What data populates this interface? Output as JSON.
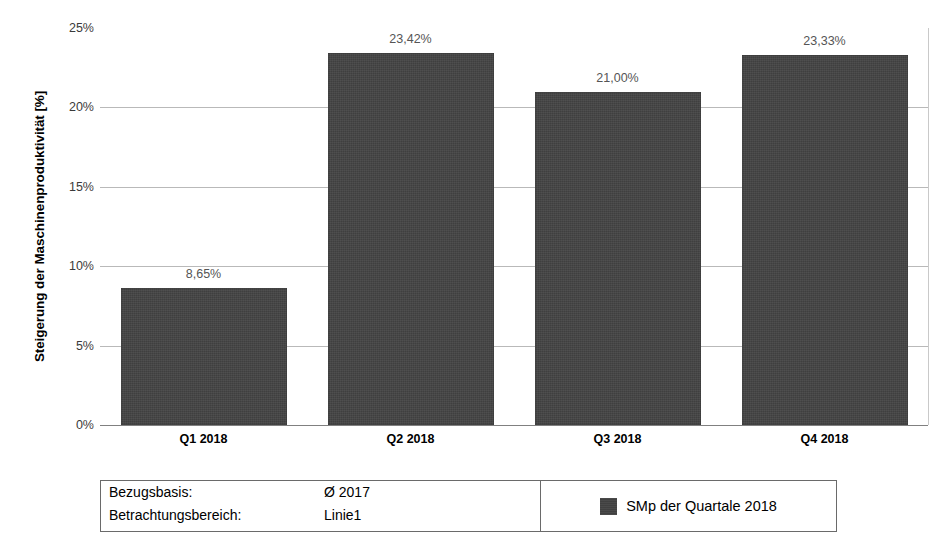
{
  "chart_data": {
    "type": "bar",
    "title": "",
    "subtitle": "",
    "xlabel": "",
    "ylabel": "Steigerung der Maschinenproduktivität [%]",
    "categories": [
      "Q1 2018",
      "Q2 2018",
      "Q3 2018",
      "Q4 2018"
    ],
    "values": [
      8.65,
      23.42,
      21.0,
      23.33
    ],
    "data_labels": [
      "8,65%",
      "23,42%",
      "23,42%",
      "23,33%"
    ],
    "point_labels": [
      "8,65%",
      "23,42%",
      "21,00%",
      "23,33%"
    ],
    "ylim": [
      0,
      25
    ],
    "ytick_values": [
      0,
      5,
      10,
      15,
      20,
      25
    ],
    "ytick_labels": [
      "0%",
      "5%",
      "10%",
      "15%",
      "20%",
      "25%"
    ],
    "grid": true,
    "grid_axis": "y",
    "legend_position": "bottom-right",
    "series": [
      {
        "name": "SMp der Quartale 2018",
        "color": "#434343",
        "values": [
          8.65,
          23.42,
          21.0,
          23.33
        ]
      }
    ],
    "bar_color": "#434343",
    "grid_color": "#b9b9b9",
    "axis_color": "#808080",
    "label_color": "#555555"
  },
  "legend": {
    "swatch_color": "#434343",
    "label": "SMp der Quartale 2018"
  },
  "footer": {
    "rows": [
      {
        "key": "Bezugsbasis:",
        "value": "Ø 2017"
      },
      {
        "key": "Betrachtungsbereich:",
        "value": "Linie1"
      }
    ]
  }
}
